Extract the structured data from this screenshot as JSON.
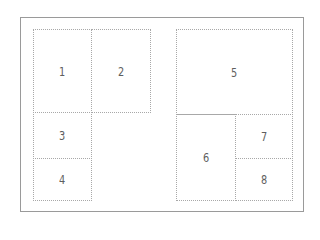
{
  "diagram": {
    "type": "page-layout-grid",
    "colors": {
      "frame": "#9a9a9a",
      "cell_border": "#a8a8a8",
      "label": "#5e5e5e",
      "background": "#ffffff"
    },
    "panels": [
      {
        "id": "left",
        "cells": [
          {
            "label": "1",
            "x": 33,
            "y": 29,
            "w": 58,
            "h": 83
          },
          {
            "label": "2",
            "x": 91,
            "y": 29,
            "w": 59,
            "h": 83
          },
          {
            "label": "3",
            "x": 33,
            "y": 112,
            "w": 58,
            "h": 46
          },
          {
            "label": "4",
            "x": 33,
            "y": 158,
            "w": 58,
            "h": 42
          }
        ]
      },
      {
        "id": "right",
        "cells": [
          {
            "label": "5",
            "x": 176,
            "y": 29,
            "w": 116,
            "h": 85
          },
          {
            "label": "6",
            "x": 176,
            "y": 114,
            "w": 59,
            "h": 86
          },
          {
            "label": "7",
            "x": 235,
            "y": 114,
            "w": 57,
            "h": 44
          },
          {
            "label": "8",
            "x": 235,
            "y": 158,
            "w": 57,
            "h": 42
          }
        ]
      }
    ]
  }
}
